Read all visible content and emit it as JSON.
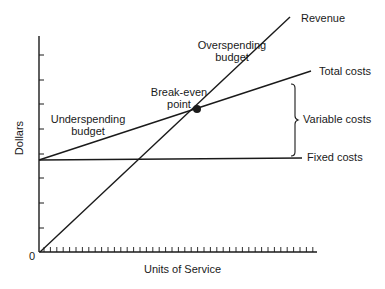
{
  "chart_data": {
    "type": "line",
    "title": "",
    "xlabel": "Units of Service",
    "ylabel": "Dollars",
    "origin_label": "0",
    "grid": false,
    "legend": "none (direct line labels)",
    "x_range": [
      0,
      100
    ],
    "y_range": [
      0,
      100
    ],
    "series": [
      {
        "name": "Revenue",
        "x": [
          0,
          90
        ],
        "y": [
          0,
          108
        ]
      },
      {
        "name": "Total costs",
        "x": [
          0,
          98
        ],
        "y": [
          42,
          83
        ]
      },
      {
        "name": "Fixed costs",
        "x": [
          0,
          94
        ],
        "y": [
          42,
          43
        ]
      }
    ],
    "annotations": [
      {
        "text": "Break-even point",
        "type": "point",
        "x": 57,
        "y": 66
      },
      {
        "text": "Overspending budget",
        "region": "between Revenue and Total costs, right of break-even"
      },
      {
        "text": "Underspending budget",
        "region": "between Total costs and Revenue, left of break-even"
      },
      {
        "text": "Variable costs",
        "type": "brace",
        "spans": "Fixed costs to Total costs"
      }
    ]
  },
  "labels": {
    "revenue": "Revenue",
    "total_costs": "Total costs",
    "variable_costs": "Variable costs",
    "fixed_costs": "Fixed costs",
    "overspending_line1": "Overspending",
    "overspending_line2": "budget",
    "underspending_line1": "Underspending",
    "underspending_line2": "budget",
    "breakeven_line1": "Break-even",
    "breakeven_line2": "point",
    "y_axis": "Dollars",
    "x_axis": "Units of Service",
    "origin": "0"
  },
  "colors": {
    "ink": "#1a1a1a",
    "background": "#ffffff"
  }
}
